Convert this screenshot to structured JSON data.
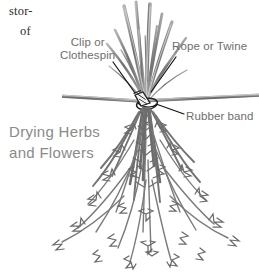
{
  "figure": {
    "caption_line1": "Drying Herbs",
    "caption_line2": "and Flowers",
    "caption_color": "#8a8a8a",
    "background_color": "#ffffff",
    "ink_color": "#6e6e6e",
    "text_color": "#2b2b2b"
  },
  "page_fragments": {
    "top_left_1": "stor-",
    "top_left_2": "of"
  },
  "callouts": {
    "clip_line1": "Clip or",
    "clip_line2": "Clothespin",
    "rope": "Rope or Twine",
    "rubber_band": "Rubber band"
  },
  "illustration": {
    "subject": "bundle-of-herbs-hanging-upside-down-from-a-rope",
    "parts": [
      "rope-or-twine",
      "clothespin-clip",
      "rubber-band",
      "cut-stems",
      "drooping-foliage"
    ]
  }
}
